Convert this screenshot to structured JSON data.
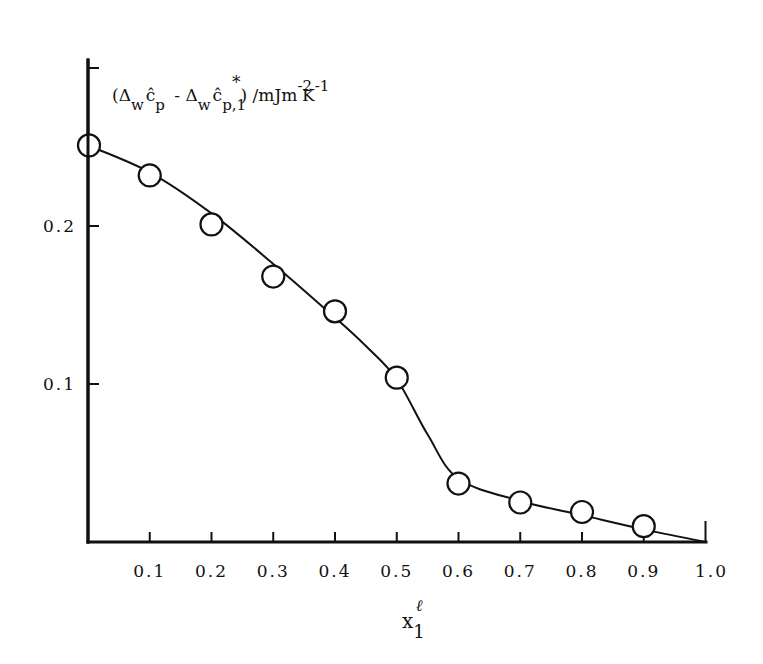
{
  "chart_data": {
    "type": "scatter",
    "title": "",
    "xlabel": "x₁ˡ",
    "xlabel_parts": {
      "base": "x",
      "sub": "1",
      "sup": "ℓ"
    },
    "ylabel": "(Δwĉp - Δwĉp,1*) / mJm⁻²K⁻¹",
    "ylabel_parts": {
      "open": "(Δ",
      "sub1": "w",
      "c1": "ĉ",
      "sub2": "p",
      "minus": " - Δ",
      "sub3": "w",
      "c2": "ĉ",
      "sub4": "p,1",
      "star": "*",
      "close": ") /mJm",
      "exp1": "-2",
      "k": "K",
      "exp2": "-1"
    },
    "xlim": [
      0,
      1.0
    ],
    "ylim": [
      0,
      0.3
    ],
    "x_ticks": [
      0.1,
      0.2,
      0.3,
      0.4,
      0.5,
      0.6,
      0.7,
      0.8,
      0.9,
      1.0
    ],
    "x_tick_labels": [
      "0.1",
      "0.2",
      "0.3",
      "0.4",
      "0.5",
      "0.6",
      "0.7",
      "0.8",
      "0.9",
      "1.0"
    ],
    "y_ticks": [
      0.1,
      0.2,
      0.3
    ],
    "y_tick_labels": [
      "0.1",
      "0.2",
      ""
    ],
    "grid": false,
    "legend": null,
    "series": [
      {
        "name": "experimental points",
        "style": "open-circle",
        "x": [
          0.0,
          0.1,
          0.2,
          0.3,
          0.4,
          0.5,
          0.6,
          0.7,
          0.8,
          0.9
        ],
        "y": [
          0.251,
          0.232,
          0.201,
          0.168,
          0.146,
          0.104,
          0.037,
          0.025,
          0.019,
          0.01
        ]
      },
      {
        "name": "fitted curve",
        "style": "smooth-line",
        "x": [
          0.0,
          0.1,
          0.2,
          0.3,
          0.4,
          0.45,
          0.5,
          0.55,
          0.6,
          0.7,
          0.8,
          0.9,
          1.0
        ],
        "y": [
          0.251,
          0.234,
          0.208,
          0.176,
          0.142,
          0.124,
          0.103,
          0.068,
          0.04,
          0.026,
          0.017,
          0.008,
          0.0
        ]
      }
    ]
  }
}
